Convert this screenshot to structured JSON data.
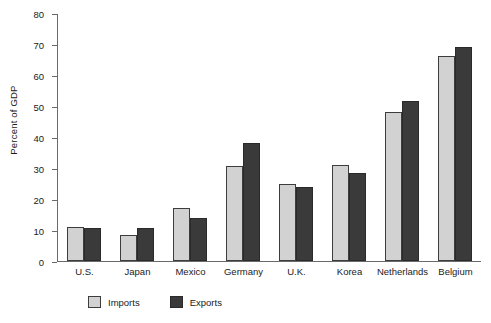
{
  "chart_data": {
    "type": "bar",
    "title": "",
    "xlabel": "",
    "ylabel": "Percent of GDP",
    "ylim": [
      0,
      80
    ],
    "yticks": [
      0,
      10,
      20,
      30,
      40,
      50,
      60,
      70,
      80
    ],
    "grid": false,
    "legend_position": "bottom-left",
    "categories": [
      "U.S.",
      "Japan",
      "Mexico",
      "Germany",
      "U.K.",
      "Korea",
      "Netherlands",
      "Belgium"
    ],
    "series": [
      {
        "name": "Imports",
        "color": "#d2d2d2",
        "values": [
          11,
          8.5,
          17,
          30.5,
          25,
          31,
          48,
          66
        ]
      },
      {
        "name": "Exports",
        "color": "#3a3a3a",
        "values": [
          10.5,
          10.5,
          14,
          38,
          24,
          28.5,
          51.5,
          69
        ]
      }
    ]
  }
}
